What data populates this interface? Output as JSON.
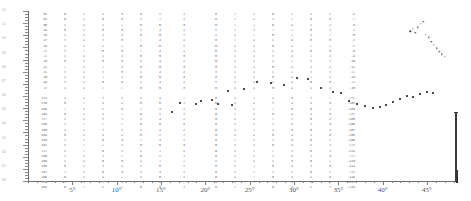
{
  "figure": {
    "title": "",
    "type": "scatter-with-data-table"
  },
  "x_axis": {
    "label": "",
    "unit": "degrees",
    "tick_labels": [
      "5°",
      "10°",
      "15°",
      "20°",
      "25°",
      "30°",
      "35°",
      "40°",
      "45°"
    ],
    "tick_values": [
      5,
      10,
      15,
      20,
      25,
      30,
      35,
      40,
      45
    ],
    "range": [
      0,
      48.5
    ],
    "minor_ticks_per_major": 5
  },
  "y_axis": {
    "label": "",
    "tick_labels": [
      "1.2",
      "1.1",
      "1.0",
      "0.9",
      "0.8",
      "0.7",
      "0.6",
      "0.5",
      "0.4",
      "0.3",
      "0.2",
      "0.1",
      "0.0"
    ]
  },
  "chart_data": {
    "type": "scatter",
    "title": "",
    "xlabel": "",
    "ylabel": "",
    "xlim": [
      0,
      48.5
    ],
    "ylim": [
      0,
      1
    ],
    "grid": false,
    "legend": "none",
    "series": [
      {
        "name": "main-trace",
        "x": [
          16.2,
          18.9,
          20.8,
          22.6,
          24.4,
          25.8,
          27.4,
          28.9,
          30.3,
          31.6,
          33.1,
          34.4,
          35.3,
          36.2,
          37.1,
          38.0,
          38.9,
          39.7,
          40.4,
          41.2,
          42.0,
          42.7,
          43.4,
          44.2,
          45.0,
          45.7
        ],
        "y": [
          0.405,
          0.455,
          0.475,
          0.53,
          0.54,
          0.585,
          0.575,
          0.565,
          0.605,
          0.6,
          0.545,
          0.525,
          0.52,
          0.47,
          0.455,
          0.44,
          0.43,
          0.435,
          0.45,
          0.465,
          0.48,
          0.5,
          0.495,
          0.51,
          0.525,
          0.515
        ]
      },
      {
        "name": "upper-cluster",
        "x": [
          43.1,
          43.4,
          43.7,
          44.0,
          44.3,
          44.6,
          44.9,
          45.2,
          45.5,
          45.8,
          46.1,
          46.4,
          46.7,
          47.0
        ],
        "y": [
          0.88,
          0.895,
          0.87,
          0.905,
          0.925,
          0.935,
          0.86,
          0.845,
          0.82,
          0.8,
          0.78,
          0.76,
          0.745,
          0.73
        ]
      },
      {
        "name": "lower-left-points",
        "x": [
          17.2,
          19.5,
          21.4,
          23.0
        ],
        "y": [
          0.46,
          0.47,
          0.455,
          0.445
        ]
      }
    ]
  },
  "data_table": {
    "upper_block": {
      "left_group_columns": [
        [
          "31",
          "31",
          "30",
          "29",
          "28",
          "27",
          "26",
          "25",
          "24",
          "23",
          "22",
          "21",
          "20",
          "19",
          "18"
        ],
        [
          "0",
          "0",
          "1",
          "0",
          "1",
          "0",
          "1",
          "0",
          "1",
          "0",
          "1",
          "0",
          "1",
          "0",
          "1"
        ],
        [
          "2",
          "2",
          "1",
          "2",
          "1",
          "2",
          "1",
          "2",
          "1",
          "2",
          "1",
          "2",
          "1",
          "2",
          "1"
        ],
        [
          "1",
          "0",
          "1",
          "0",
          "1",
          "0",
          "1",
          "0",
          "1",
          "0",
          "1",
          "0",
          "1",
          "0",
          "1"
        ],
        [
          "3",
          "3",
          "2",
          "3",
          "2",
          "3",
          "2",
          "3",
          "2",
          "3",
          "2",
          "3",
          "2",
          "3",
          "2"
        ],
        [
          "0",
          "1",
          "0",
          "1",
          "0",
          "1",
          "0",
          "1",
          "0",
          "1",
          "0",
          "1",
          "0",
          "1",
          "0"
        ],
        [
          "5",
          "4",
          "5",
          "4",
          "5",
          "4",
          "5",
          "4",
          "5",
          "4",
          "5",
          "4",
          "5",
          "4",
          "5"
        ],
        [
          "2",
          "2",
          "3",
          "2",
          "3",
          "2",
          "3",
          "2",
          "3",
          "2",
          "3",
          "2",
          "3",
          "2",
          "3"
        ]
      ],
      "right_group_columns": [
        [
          "0",
          "0",
          "0",
          "0",
          "0",
          "0",
          "0",
          "0",
          "0",
          "0",
          "0",
          "0",
          "0",
          "0",
          "0"
        ],
        [
          "1",
          "1",
          "1",
          "1",
          "1",
          "1",
          "1",
          "1",
          "1",
          "1",
          "1",
          "1",
          "1",
          "1",
          "1"
        ],
        [
          "2",
          "2",
          "2",
          "2",
          "2",
          "2",
          "2",
          "2",
          "2",
          "2",
          "2",
          "2",
          "2",
          "2",
          "2"
        ],
        [
          "0",
          "1",
          "0",
          "1",
          "0",
          "1",
          "0",
          "1",
          "0",
          "1",
          "0",
          "1",
          "0",
          "1",
          "0"
        ],
        [
          "4",
          "4",
          "4",
          "4",
          "4",
          "4",
          "4",
          "4",
          "4",
          "4",
          "4",
          "4",
          "4",
          "4",
          "4"
        ],
        [
          "1",
          "0",
          "1",
          "0",
          "1",
          "0",
          "1",
          "0",
          "1",
          "0",
          "1",
          "0",
          "1",
          "0",
          "1"
        ],
        [
          "2",
          "3",
          "2",
          "3",
          "2",
          "3",
          "2",
          "3",
          "2",
          "3",
          "2",
          "3",
          "2",
          "3",
          "2"
        ],
        [
          "-1",
          "-2",
          "-3",
          "-4",
          "-5",
          "-6",
          "-7",
          "-8",
          "-9",
          "-10",
          "-11",
          "-12",
          "-13",
          "-14",
          "-15"
        ]
      ]
    },
    "lower_block": {
      "left_group_columns": [
        [
          "171",
          "170",
          "169",
          "168",
          "167",
          "166",
          "165",
          "164",
          "163",
          "162",
          "161",
          "160",
          "159",
          "158",
          "157",
          "156",
          "155",
          "154"
        ],
        [
          "1",
          "0",
          "1",
          "0",
          "1",
          "0",
          "1",
          "0",
          "1",
          "0",
          "1",
          "0",
          "1",
          "0",
          "1",
          "0",
          "1",
          "0"
        ],
        [
          "2",
          "2",
          "1",
          "2",
          "1",
          "2",
          "1",
          "2",
          "1",
          "2",
          "1",
          "2",
          "1",
          "2",
          "1",
          "2",
          "1",
          "2"
        ],
        [
          "0",
          "1",
          "0",
          "1",
          "0",
          "1",
          "0",
          "1",
          "0",
          "1",
          "0",
          "1",
          "0",
          "1",
          "0",
          "1",
          "0",
          "1"
        ],
        [
          "3",
          "2",
          "3",
          "2",
          "3",
          "2",
          "3",
          "2",
          "3",
          "2",
          "3",
          "2",
          "3",
          "2",
          "3",
          "2",
          "3",
          "2"
        ],
        [
          "1",
          "0",
          "1",
          "0",
          "1",
          "0",
          "1",
          "0",
          "1",
          "0",
          "1",
          "0",
          "1",
          "0",
          "1",
          "0",
          "1",
          "0"
        ],
        [
          "4",
          "5",
          "4",
          "5",
          "4",
          "5",
          "4",
          "5",
          "4",
          "5",
          "4",
          "5",
          "4",
          "5",
          "4",
          "5",
          "4",
          "5"
        ],
        [
          "2",
          "3",
          "2",
          "3",
          "2",
          "3",
          "2",
          "3",
          "2",
          "3",
          "2",
          "3",
          "2",
          "3",
          "2",
          "3",
          "2",
          "3"
        ]
      ],
      "right_group_columns": [
        [
          "0",
          "0",
          "0",
          "0",
          "0",
          "0",
          "0",
          "0",
          "0",
          "0",
          "0",
          "0",
          "0",
          "0",
          "0",
          "0",
          "0",
          "0"
        ],
        [
          "1",
          "1",
          "1",
          "1",
          "1",
          "1",
          "1",
          "1",
          "1",
          "1",
          "1",
          "1",
          "1",
          "1",
          "1",
          "1",
          "1",
          "1"
        ],
        [
          "2",
          "2",
          "2",
          "2",
          "2",
          "2",
          "2",
          "2",
          "2",
          "2",
          "2",
          "2",
          "2",
          "2",
          "2",
          "2",
          "2",
          "2"
        ],
        [
          "1",
          "0",
          "1",
          "0",
          "1",
          "0",
          "1",
          "0",
          "1",
          "0",
          "1",
          "0",
          "1",
          "0",
          "1",
          "0",
          "1",
          "0"
        ],
        [
          "3",
          "4",
          "3",
          "4",
          "3",
          "4",
          "3",
          "4",
          "3",
          "4",
          "3",
          "4",
          "3",
          "4",
          "3",
          "4",
          "3",
          "4"
        ],
        [
          "0",
          "1",
          "0",
          "1",
          "0",
          "1",
          "0",
          "1",
          "0",
          "1",
          "0",
          "1",
          "0",
          "1",
          "0",
          "1",
          "0",
          "1"
        ],
        [
          "2",
          "3",
          "2",
          "3",
          "2",
          "3",
          "2",
          "3",
          "2",
          "3",
          "2",
          "3",
          "2",
          "3",
          "2",
          "3",
          "2",
          "3"
        ],
        [
          "-101",
          "-102",
          "-103",
          "-104",
          "-105",
          "-106",
          "-107",
          "-108",
          "-109",
          "-110",
          "-111",
          "-112",
          "-113",
          "-114",
          "-115",
          "-116",
          "-117",
          "-118"
        ]
      ]
    }
  },
  "colors": {
    "ink": "#4a4a4a",
    "point": "#3d3d3f",
    "axis": "#6e6e6e",
    "faint": "#a6a6a6",
    "background": "#ffffff"
  }
}
